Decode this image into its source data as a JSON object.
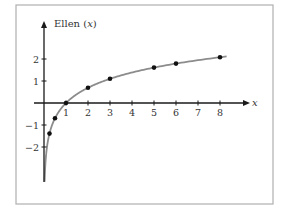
{
  "chart_data": {
    "type": "line",
    "title": "",
    "ylabel": "Ellen (x)",
    "ylabel_name": "Ellen",
    "ylabel_var": "x",
    "xlabel": "x",
    "function": "ln(x)",
    "xlim": [
      0,
      8.3
    ],
    "ylim": [
      -2.9,
      2.6
    ],
    "x_ticks": [
      1,
      2,
      3,
      4,
      5,
      6,
      7,
      8
    ],
    "y_ticks": [
      -2,
      -1,
      1,
      2
    ],
    "x_tick_labels": [
      "1",
      "2",
      "3",
      "4",
      "5",
      "6",
      "7",
      "8"
    ],
    "y_tick_labels": [
      "−2",
      "−1",
      "1",
      "2"
    ],
    "grid": false,
    "legend": null,
    "series": [
      {
        "name": "Ellen (x)",
        "kind": "curve",
        "x": [
          0.02,
          0.05,
          0.1,
          0.25,
          0.5,
          1,
          2,
          3,
          4,
          5,
          6,
          7,
          8,
          8.3
        ],
        "y": [
          -3.91,
          -3.0,
          -2.3,
          -1.39,
          -0.69,
          0,
          0.69,
          1.1,
          1.39,
          1.61,
          1.79,
          1.95,
          2.08,
          2.12
        ]
      },
      {
        "name": "points",
        "kind": "scatter",
        "x": [
          0.25,
          0.5,
          1,
          2,
          3,
          5,
          6,
          8
        ],
        "y": [
          -1.39,
          -0.69,
          0,
          0.69,
          1.1,
          1.61,
          1.79,
          2.08
        ]
      }
    ]
  },
  "colors": {
    "axis": "#1a1a1a",
    "curve": "#8c8c8c",
    "points": "#111111",
    "frame": "#b0b0b0"
  }
}
